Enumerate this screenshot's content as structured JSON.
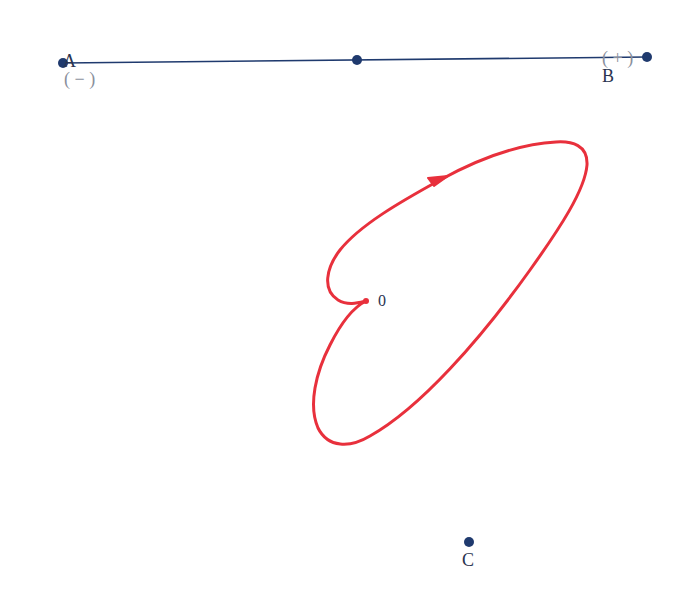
{
  "diagram": {
    "line": {
      "start_label": "A",
      "start_sign": "( − )",
      "end_label": "B",
      "end_sign": "( + )",
      "color": "#1f3a6e"
    },
    "points": {
      "a": {
        "label": "A",
        "x": 63,
        "y": 63
      },
      "mid": {
        "label": "",
        "x": 357,
        "y": 60
      },
      "b": {
        "label": "B",
        "x": 647,
        "y": 57
      },
      "c": {
        "label": "C",
        "x": 469,
        "y": 542
      },
      "origin": {
        "label": "0",
        "x": 366,
        "y": 301
      }
    },
    "curve": {
      "color": "#e8303c",
      "direction": "arrow along upper-left edge pointing up-right",
      "closed": true
    },
    "labels": {
      "a_letter": "A",
      "a_sign": "( − )",
      "b_sign": "( + )",
      "b_letter": "B",
      "c_letter": "C",
      "origin": "0"
    }
  }
}
